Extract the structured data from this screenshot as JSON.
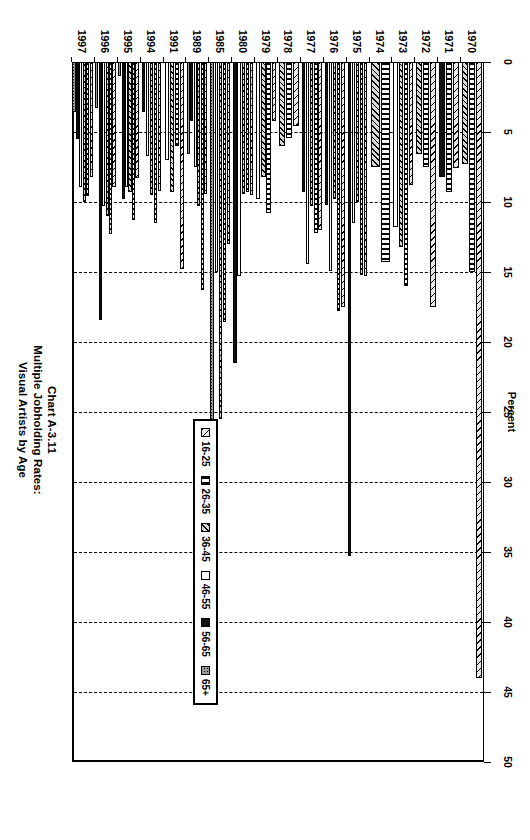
{
  "title": {
    "line1": "Chart A-3.11",
    "line2": "Multiple Jobholding Rates:",
    "line3": "Visual Artists by Age"
  },
  "legend": {
    "position": "inside-lower-right",
    "entries": [
      {
        "label": "16-25",
        "pattern": "light-diagonal-hatch"
      },
      {
        "label": "26-35",
        "pattern": "vertical-brick"
      },
      {
        "label": "36-45",
        "pattern": "dense-back-diagonal-hatch"
      },
      {
        "label": "46-55",
        "pattern": "white"
      },
      {
        "label": "56-65",
        "pattern": "solid-black"
      },
      {
        "label": "65+",
        "pattern": "grey-stipple"
      }
    ]
  },
  "chart_data": {
    "type": "bar",
    "orientation": "horizontal",
    "title": "Chart A-3.11 Multiple Jobholding Rates: Visual Artists by Age",
    "xlabel": "Percent",
    "ylabel": "",
    "xlim": [
      0,
      50
    ],
    "xticks": [
      0,
      5,
      10,
      15,
      20,
      25,
      30,
      35,
      40,
      45,
      50
    ],
    "grid": "vertical-dashed",
    "categories": [
      "1970",
      "1971",
      "1972",
      "1973",
      "1974",
      "1975",
      "1976",
      "1977",
      "1978",
      "1979",
      "1980",
      "1985",
      "1989",
      "1991",
      "1994",
      "1995",
      "1996",
      "1997"
    ],
    "series": [
      {
        "name": "16-25",
        "values": [
          44.0,
          7.6,
          17.5,
          8.8,
          0.0,
          15.3,
          17.5,
          12.0,
          4.6,
          4.2,
          9.5,
          13.0,
          9.4,
          14.8,
          9.2,
          8.3,
          8.9,
          8.2
        ]
      },
      {
        "name": "26-35",
        "values": [
          15.0,
          9.3,
          7.5,
          16.0,
          14.3,
          15.2,
          17.8,
          12.2,
          5.4,
          10.8,
          9.3,
          18.6,
          16.3,
          6.0,
          11.5,
          11.3,
          12.3,
          9.6
        ]
      },
      {
        "name": "36-45",
        "values": [
          7.3,
          0.0,
          6.6,
          13.2,
          7.5,
          10.0,
          9.8,
          10.3,
          6.0,
          8.2,
          9.4,
          25.5,
          10.3,
          9.3,
          9.5,
          9.3,
          11.0,
          10.0
        ]
      },
      {
        "name": "46-55",
        "values": [
          0.0,
          0.0,
          0.0,
          11.8,
          0.0,
          11.5,
          14.9,
          14.4,
          0.0,
          9.8,
          15.3,
          15.0,
          7.5,
          7.0,
          6.7,
          8.9,
          10.3,
          8.9
        ]
      },
      {
        "name": "56-65",
        "values": [
          0.0,
          8.2,
          0.0,
          0.0,
          0.0,
          35.3,
          10.2,
          9.3,
          0.0,
          0.0,
          21.5,
          0.0,
          4.2,
          0.0,
          3.6,
          9.8,
          18.4,
          5.5
        ]
      },
      {
        "name": "65+",
        "values": [
          0.0,
          0.0,
          0.0,
          0.0,
          0.0,
          0.0,
          0.0,
          0.0,
          0.0,
          0.0,
          0.0,
          30.5,
          6.6,
          0.0,
          0.0,
          1.0,
          3.3,
          3.6
        ]
      }
    ]
  }
}
